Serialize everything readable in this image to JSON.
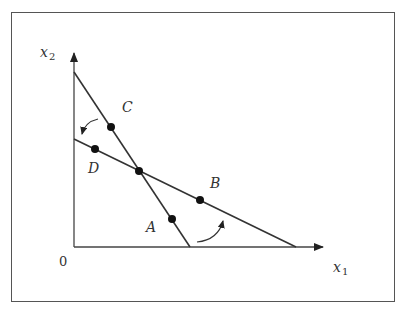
{
  "diagram": {
    "axes": {
      "x_label": "x",
      "x_sub": "1",
      "y_label": "x",
      "y_sub": "2",
      "origin_label": "0"
    },
    "lines": [
      {
        "name": "steep-line",
        "from": [
          74,
          72
        ],
        "to": [
          190,
          247
        ]
      },
      {
        "name": "shallow-line",
        "from": [
          74,
          139
        ],
        "to": [
          296,
          247
        ]
      }
    ],
    "points": [
      {
        "label": "A",
        "x": 172,
        "y": 219,
        "label_x": 146,
        "label_y": 232
      },
      {
        "label": "B",
        "x": 200,
        "y": 200,
        "label_x": 211,
        "label_y": 188
      },
      {
        "label": "C",
        "x": 111,
        "y": 127,
        "label_x": 122,
        "label_y": 110
      },
      {
        "label": "D",
        "x": 95,
        "y": 149,
        "label_x": 88,
        "label_y": 172
      }
    ],
    "colors": {
      "line": "#333333",
      "frame": "#555555",
      "background": "#ffffff"
    }
  }
}
